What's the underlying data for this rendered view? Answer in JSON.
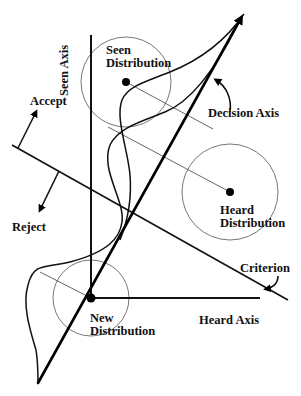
{
  "diagram": {
    "type": "signal-detection-decision-space",
    "colors": {
      "line": "#000000",
      "thin_line": "#555555",
      "circle": "#666666",
      "background": "#ffffff"
    },
    "axes": {
      "seen_axis_label": "Seen Axis",
      "heard_axis_label": "Heard Axis",
      "decision_axis_label": "Decision Axis"
    },
    "distributions": {
      "seen": {
        "line1": "Seen",
        "line2": "Distribution"
      },
      "heard": {
        "line1": "Heard",
        "line2": "Distribution"
      },
      "new": {
        "line1": "New",
        "line2": "Distribution"
      }
    },
    "criterion_label": "Criterion",
    "responses": {
      "accept_label": "Accept",
      "reject_label": "Reject"
    }
  }
}
